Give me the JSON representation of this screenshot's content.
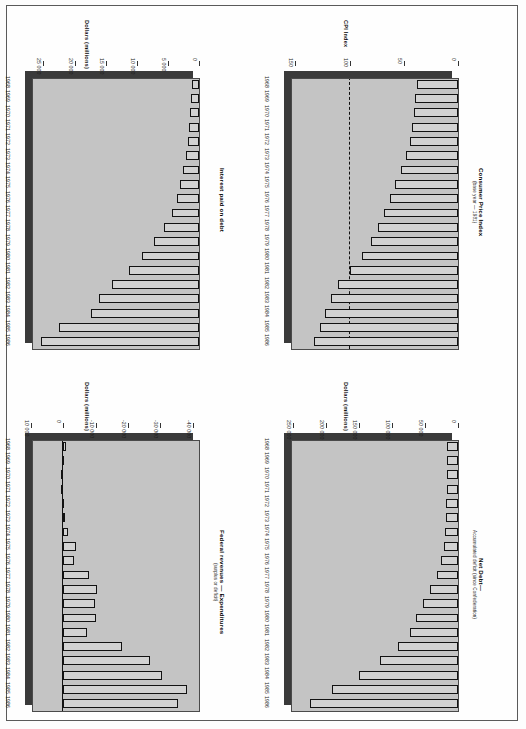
{
  "page": {
    "kind": "scanned-report-page",
    "chart_count": 4
  },
  "charts": [
    {
      "id": "interest-paid-on-debt",
      "position": "top-left",
      "chart_data": {
        "type": "bar",
        "orientation": "horizontal",
        "title": "Interest paid on debt",
        "subtitle": "",
        "xlabel": "",
        "ylabel": "Dollars (millions)",
        "axis_title": "Dollars (millions)",
        "categories": [
          "1968",
          "1969",
          "1970",
          "1971",
          "1972",
          "1973",
          "1974",
          "1975",
          "1976",
          "1977",
          "1978",
          "1979",
          "1980",
          "1981",
          "1982",
          "1983",
          "1984",
          "1985",
          "1986"
        ],
        "values": [
          1100,
          1250,
          1500,
          1650,
          1800,
          2050,
          2500,
          3000,
          3600,
          4400,
          5700,
          7300,
          9200,
          11200,
          14000,
          16000,
          17400,
          22500,
          25400
        ],
        "tick_labels": [
          "25 000",
          "20 000",
          "15 000",
          "10 000",
          "5 000",
          "0"
        ],
        "tick_values": [
          25000,
          20000,
          15000,
          10000,
          5000,
          0
        ],
        "xlim": [
          0,
          27000
        ],
        "grid": false,
        "legend": "none",
        "reference_line": null
      }
    },
    {
      "id": "consumer-price-index",
      "position": "top-right",
      "chart_data": {
        "type": "bar",
        "orientation": "horizontal",
        "title": "Consumer Price Index",
        "subtitle": "(base year — 1981)",
        "xlabel": "",
        "ylabel": "CPI Index",
        "axis_title": "CPI Index",
        "categories": [
          "1968",
          "1969",
          "1970",
          "1971",
          "1972",
          "1973",
          "1974",
          "1975",
          "1976",
          "1977",
          "1978",
          "1979",
          "1980",
          "1981",
          "1982",
          "1983",
          "1984",
          "1985",
          "1986"
        ],
        "values": [
          38.0,
          39.8,
          41.0,
          42.2,
          44.2,
          47.6,
          52.8,
          58.5,
          62.9,
          67.9,
          73.9,
          80.7,
          88.9,
          100.0,
          110.8,
          117.2,
          122.3,
          127.2,
          132.4
        ],
        "tick_labels": [
          "150",
          "100",
          "50",
          "0"
        ],
        "tick_values": [
          150,
          100,
          50,
          0
        ],
        "xlim": [
          0,
          155
        ],
        "grid": false,
        "legend": "none",
        "reference_line": {
          "value": 100,
          "style": "dashed",
          "label": "base year 1981"
        }
      }
    },
    {
      "id": "federal-revenues-minus-expenditures",
      "position": "bottom-left",
      "chart_data": {
        "type": "bar",
        "orientation": "horizontal",
        "title": "Federal revenues — Expenditures",
        "subtitle": "(surplus or deficit)",
        "xlabel": "",
        "ylabel": "Dollars (millions)",
        "axis_title": "Dollars (millions)",
        "categories": [
          "1968",
          "1969",
          "1970",
          "1971",
          "1972",
          "1973",
          "1974",
          "1975",
          "1976",
          "1977",
          "1978",
          "1979",
          "1980",
          "1981",
          "1982",
          "1983",
          "1984",
          "1985",
          "1986"
        ],
        "values": [
          -800,
          -300,
          250,
          200,
          -100,
          -400,
          -1300,
          -3800,
          -3300,
          -8100,
          -10400,
          -9800,
          -10100,
          -7300,
          -18100,
          -26900,
          -30500,
          -38300,
          -35500
        ],
        "tick_labels": [
          "10 000",
          "0",
          "-10 000",
          "-20 000",
          "-30 000",
          "-40 000"
        ],
        "tick_values": [
          10000,
          0,
          -10000,
          -20000,
          -30000,
          -40000
        ],
        "xlim": [
          -42000,
          10000
        ],
        "grid": false,
        "legend": "none",
        "reference_line": {
          "value": 0,
          "style": "solid",
          "label": "zero"
        }
      }
    },
    {
      "id": "net-debt",
      "position": "bottom-right",
      "chart_data": {
        "type": "bar",
        "orientation": "horizontal",
        "title": "Net Debt—",
        "subtitle": "Accumulated deficit (since Confederation)",
        "xlabel": "",
        "ylabel": "Dollars (millions)",
        "axis_title": "Dollars (millions)",
        "categories": [
          "1968",
          "1969",
          "1970",
          "1971",
          "1972",
          "1973",
          "1974",
          "1975",
          "1976",
          "1977",
          "1978",
          "1979",
          "1980",
          "1981",
          "1982",
          "1983",
          "1984",
          "1985",
          "1986"
        ],
        "values": [
          16500,
          17000,
          17200,
          17400,
          17800,
          18200,
          19500,
          22000,
          25500,
          32500,
          43000,
          53500,
          64000,
          72500,
          90500,
          118000,
          150000,
          192000,
          224000
        ],
        "tick_labels": [
          "250 000",
          "200 000",
          "150 000",
          "100 000",
          "50 000",
          "0"
        ],
        "tick_values": [
          250000,
          200000,
          150000,
          100000,
          50000,
          0
        ],
        "xlim": [
          0,
          255000
        ],
        "grid": false,
        "legend": "none",
        "reference_line": null
      }
    }
  ]
}
